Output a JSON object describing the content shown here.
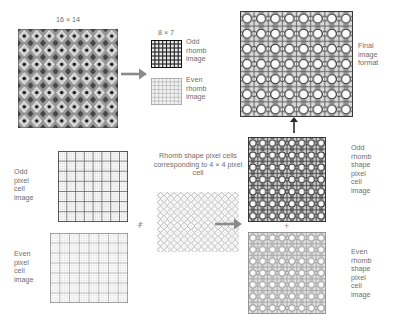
{
  "figure": {
    "type": "diagram",
    "background": "#ffffff",
    "text_color": "#6e6e6e"
  },
  "labels": {
    "source_dims": "16 × 14",
    "sub_dims": "8 × 7",
    "odd_rhomb_image": "Odd\nrhomb\nimage",
    "even_rhomb_image": "Even\nrhomb\nimage",
    "final_image_format": "Final\nimage\nformat",
    "odd_pixel_cell_image": "Odd\npixel\ncell\nimage",
    "even_pixel_cell_image": "Even\npixel\ncell\nimage",
    "rhomb_shape_caption": "Rhomb shape\npixel cells\ncorresponding to\n4 × 4 pixel cell",
    "odd_rhomb_shape_pixel_cell_image": "Odd\nrhomb\nshape\npixel\ncell\nimage",
    "even_rhomb_shape_pixel_cell_image": "Even\nrhomb\nshape\npixel\ncell\nimage",
    "plus_top": "+",
    "plus_bottom": "+",
    "plus_right": "+"
  },
  "grids": {
    "source_image": {
      "cols": 16,
      "rows": 14,
      "style": "rhomb-checker-dark"
    },
    "odd_rhomb": {
      "cols": 8,
      "rows": 7,
      "style": "dark-grid"
    },
    "even_rhomb": {
      "cols": 8,
      "rows": 7,
      "style": "light-grid"
    },
    "final_image": {
      "cols": 8,
      "rows": 7,
      "style": "rings-on-grid"
    },
    "odd_pixel_cell": {
      "cols": 8,
      "rows": 7,
      "style": "dark-thin-grid"
    },
    "even_pixel_cell": {
      "cols": 8,
      "rows": 7,
      "style": "light-thin-grid"
    },
    "rhomb_shape": {
      "cols": 12,
      "rows": 9,
      "style": "rhomb-lattice"
    },
    "odd_rhomb_shape_pixel_cell": {
      "cols": 8,
      "rows": 7,
      "style": "rings-dark"
    },
    "even_rhomb_shape_pixel_cell": {
      "cols": 8,
      "rows": 7,
      "style": "rings-light"
    }
  },
  "colors": {
    "dark_line": "#1c1c1c",
    "mid_line": "#707070",
    "light_line": "#b6b6b6",
    "fill_light": "#e6e6e6",
    "fill_mid": "#b9b9b9",
    "arrow": "#8a8a8a"
  },
  "arrows": [
    {
      "name": "arrow-source-to-subimages",
      "direction": "right"
    },
    {
      "name": "arrow-combine-to-rhomb-shape",
      "direction": "right"
    },
    {
      "name": "arrow-recombine-to-final",
      "direction": "up"
    }
  ]
}
